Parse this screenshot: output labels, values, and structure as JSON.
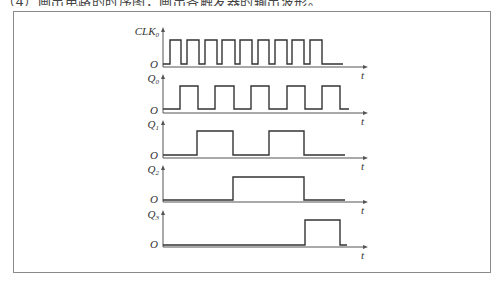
{
  "header_fragment": "（4）画出电路的时序图，画出各触发器的输出波形。",
  "diagram": {
    "time_axis_label": "t",
    "origin_label": "O",
    "signals": [
      {
        "name": "CLK",
        "subscript": "0",
        "transitions": [
          0.07,
          0.18,
          0.24,
          0.36,
          0.42,
          0.54,
          0.59,
          0.72,
          0.77,
          0.89,
          0.95,
          1.06,
          1.12,
          1.24,
          1.29,
          1.41,
          1.47,
          1.59
        ],
        "tail": 1.8
      },
      {
        "name": "Q",
        "subscript": "0",
        "transitions": [
          0.17,
          0.35,
          0.52,
          0.71,
          0.88,
          1.06,
          1.24,
          1.42,
          1.59,
          1.77
        ],
        "tail": 1.86
      },
      {
        "name": "Q",
        "subscript": "1",
        "transitions": [
          0.34,
          0.7,
          1.06,
          1.41
        ],
        "tail": 1.82
      },
      {
        "name": "Q",
        "subscript": "2",
        "transitions": [
          0.7,
          1.41
        ],
        "tail": 1.82
      },
      {
        "name": "Q",
        "subscript": "3",
        "transitions": [
          1.42,
          1.77
        ],
        "tail": 1.84
      }
    ]
  }
}
